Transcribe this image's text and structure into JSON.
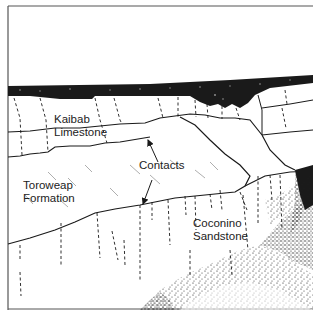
{
  "figure": {
    "type": "geologic-cross-section-sketch",
    "colors": {
      "ink": "#1a1a1a",
      "paper": "#ffffff",
      "frame": "#555555"
    }
  },
  "labels": {
    "kaibab": [
      "Kaibab",
      "Limestone"
    ],
    "toroweap": [
      "Toroweap",
      "Formation"
    ],
    "coconino": [
      "Coconino",
      "Sandstone"
    ],
    "contacts": "Contacts"
  },
  "layers": [
    {
      "name": "Kaibab Limestone",
      "position": "upper cliff"
    },
    {
      "name": "Toroweap Formation",
      "position": "middle slope"
    },
    {
      "name": "Coconino Sandstone",
      "position": "lower cliff"
    }
  ],
  "annotations": [
    {
      "text": "Contacts",
      "arrows": 2,
      "targets": [
        "Kaibab/Toroweap contact",
        "Toroweap/Coconino contact"
      ]
    }
  ]
}
